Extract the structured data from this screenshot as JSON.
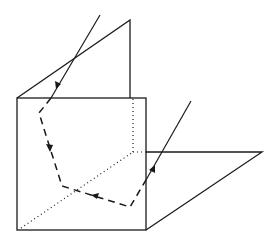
{
  "figure": {
    "colors": {
      "line": "#1a1a1a",
      "background": "#ffffff"
    },
    "elements": [
      "incoming-ray",
      "front-vertical-plane",
      "top-slanted-plane",
      "bottom-horizontal-plane",
      "hidden-edges",
      "reflected-path",
      "outgoing-ray"
    ]
  }
}
